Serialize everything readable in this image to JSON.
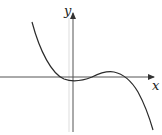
{
  "diagram": {
    "type": "cubic-function-graph",
    "axes": {
      "x_label": "x",
      "y_label": "y"
    },
    "curve": {
      "description": "Cubic with negative leading coefficient: decreasing from top-left, local minimum just below x-axis near origin, local maximum just above x-axis to the right, then decreasing steeply to bottom-right",
      "color": "#2a2a2a"
    },
    "colors": {
      "axis": "#333333",
      "guide": "#cfcfcf",
      "background": "#ffffff"
    }
  }
}
